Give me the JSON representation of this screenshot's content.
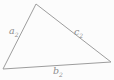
{
  "figure": {
    "type": "triangle-diagram",
    "background_color": "#fcfcfc",
    "stroke_color": "#9d9d9d",
    "label_color": "#8e8e8e",
    "triangle": {
      "points": "36,4 3,69 111,62",
      "vertices": {
        "top": [
          36,
          4
        ],
        "bottom_left": [
          3,
          69
        ],
        "bottom_right": [
          111,
          62
        ]
      }
    },
    "labels": {
      "side_left": {
        "base": "a",
        "subscript": "2"
      },
      "side_bottom": {
        "base": "b",
        "subscript": "2"
      },
      "side_right": {
        "base": "c",
        "subscript": "2"
      }
    }
  }
}
